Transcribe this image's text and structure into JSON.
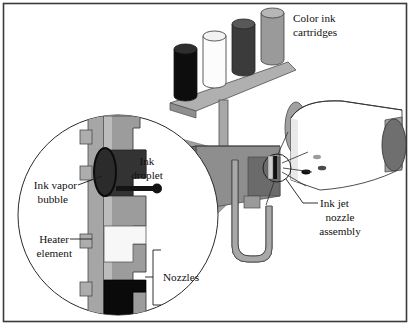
{
  "figure": {
    "border_color": "#3b3b3b",
    "background": "#ffffff"
  },
  "labels": {
    "color_ink_cartridges": {
      "line1": "Color ink",
      "line2": "cartridges"
    },
    "ink_droplet": {
      "line1": "Ink",
      "line2": "droplet"
    },
    "ink_vapor_bubble": {
      "line1": "Ink vapor",
      "line2": "bubble"
    },
    "heater_element": {
      "line1": "Heater",
      "line2": "element"
    },
    "nozzles": {
      "line1": "Nozzles"
    },
    "ink_jet_nozzle_assembly": {
      "line1": "Ink jet",
      "line2": "nozzle",
      "line3": "assembly"
    }
  },
  "cartridges": [
    {
      "name": "cartridge-black",
      "body": "#0d0d0d",
      "cap": "#2e2e2e",
      "x": 174,
      "y": 43,
      "w": 23,
      "h": 53
    },
    {
      "name": "cartridge-white",
      "body": "#fbfbfb",
      "cap": "#efefef",
      "x": 203,
      "y": 29,
      "w": 23,
      "h": 53
    },
    {
      "name": "cartridge-dark-gray",
      "body": "#3b3b3b",
      "cap": "#5a5a5a",
      "x": 232,
      "y": 18,
      "w": 23,
      "h": 53
    },
    {
      "name": "cartridge-gray",
      "body": "#9a9a9a",
      "cap": "#b4b4b4",
      "x": 261,
      "y": 6,
      "w": 23,
      "h": 53
    }
  ],
  "palette": {
    "carriage_gray": "#a8a8a8",
    "body_mid_gray": "#8e8e8e",
    "body_dark_gray": "#6f6f6f",
    "cone_gray": "#9d9d9d",
    "roll_end_gray": "#757575",
    "roll_edge_gray": "#a0a0a0",
    "paper_white": "#ffffff",
    "chamber_dark": "#333333",
    "chamber_black": "#0a0a0a",
    "heater_white": "#f7f7f7",
    "plate_gray": "#9c9c9c",
    "plate_light": "#c6c6c6",
    "outline": "#1f1f1f"
  },
  "ink_dots": [
    {
      "name": "ink-dot-dark",
      "cx": 306,
      "cy": 172,
      "rx": 4.6,
      "ry": 2.4,
      "fill": "#111111"
    },
    {
      "name": "ink-dot-mid",
      "cx": 322,
      "cy": 168,
      "rx": 4.2,
      "ry": 2.3,
      "fill": "#4a4a4a"
    },
    {
      "name": "ink-dot-light",
      "cx": 317,
      "cy": 158,
      "rx": 4.0,
      "ry": 2.2,
      "fill": "#9b9b9b"
    }
  ],
  "detail_circle": {
    "name": "magnified-nozzle-detail",
    "cx": 118,
    "cy": 215,
    "r": 100,
    "stroke": "#2b2b2b"
  },
  "nozzle_marker": {
    "name": "nozzle-assembly-marker",
    "cx": 277,
    "cy": 168,
    "r": 14
  }
}
